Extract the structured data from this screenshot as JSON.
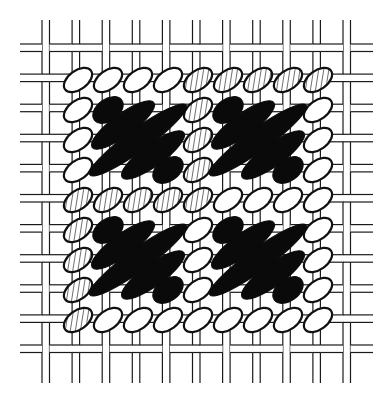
{
  "diagram": {
    "title": "",
    "canvas": {
      "thread_pairs_vertical": 11,
      "thread_pairs_horizontal": 11
    },
    "stitch_grid": {
      "columns": 9,
      "rows": 9
    },
    "colors": {
      "ink": "#111111",
      "background": "#ffffff",
      "black_stitch": "#0a0a0a"
    },
    "border_stitches": [
      {
        "col": 0,
        "row": 0,
        "fill": "white"
      },
      {
        "col": 1,
        "row": 0,
        "fill": "white"
      },
      {
        "col": 2,
        "row": 0,
        "fill": "white"
      },
      {
        "col": 3,
        "row": 0,
        "fill": "white"
      },
      {
        "col": 4,
        "row": 0,
        "fill": "hatched"
      },
      {
        "col": 5,
        "row": 0,
        "fill": "hatched"
      },
      {
        "col": 6,
        "row": 0,
        "fill": "hatched"
      },
      {
        "col": 7,
        "row": 0,
        "fill": "hatched"
      },
      {
        "col": 8,
        "row": 0,
        "fill": "hatched"
      },
      {
        "col": 0,
        "row": 1,
        "fill": "white"
      },
      {
        "col": 0,
        "row": 2,
        "fill": "white"
      },
      {
        "col": 0,
        "row": 3,
        "fill": "white"
      },
      {
        "col": 0,
        "row": 4,
        "fill": "hatched"
      },
      {
        "col": 0,
        "row": 5,
        "fill": "hatched"
      },
      {
        "col": 0,
        "row": 6,
        "fill": "hatched"
      },
      {
        "col": 0,
        "row": 7,
        "fill": "hatched"
      },
      {
        "col": 0,
        "row": 8,
        "fill": "hatched"
      },
      {
        "col": 1,
        "row": 4,
        "fill": "hatched"
      },
      {
        "col": 2,
        "row": 4,
        "fill": "hatched"
      },
      {
        "col": 3,
        "row": 4,
        "fill": "hatched"
      },
      {
        "col": 4,
        "row": 4,
        "fill": "hatched"
      },
      {
        "col": 5,
        "row": 4,
        "fill": "white"
      },
      {
        "col": 6,
        "row": 4,
        "fill": "white"
      },
      {
        "col": 7,
        "row": 4,
        "fill": "white"
      },
      {
        "col": 8,
        "row": 4,
        "fill": "white"
      },
      {
        "col": 4,
        "row": 1,
        "fill": "hatched"
      },
      {
        "col": 4,
        "row": 2,
        "fill": "hatched"
      },
      {
        "col": 4,
        "row": 3,
        "fill": "hatched"
      },
      {
        "col": 4,
        "row": 5,
        "fill": "white"
      },
      {
        "col": 4,
        "row": 6,
        "fill": "white"
      },
      {
        "col": 4,
        "row": 7,
        "fill": "white"
      },
      {
        "col": 4,
        "row": 8,
        "fill": "white"
      },
      {
        "col": 8,
        "row": 1,
        "fill": "white"
      },
      {
        "col": 8,
        "row": 2,
        "fill": "white"
      },
      {
        "col": 8,
        "row": 3,
        "fill": "white"
      },
      {
        "col": 8,
        "row": 5,
        "fill": "white"
      },
      {
        "col": 8,
        "row": 6,
        "fill": "white"
      },
      {
        "col": 8,
        "row": 7,
        "fill": "white"
      },
      {
        "col": 8,
        "row": 8,
        "fill": "white"
      },
      {
        "col": 1,
        "row": 8,
        "fill": "white"
      },
      {
        "col": 2,
        "row": 8,
        "fill": "white"
      },
      {
        "col": 3,
        "row": 8,
        "fill": "white"
      },
      {
        "col": 5,
        "row": 8,
        "fill": "white"
      },
      {
        "col": 6,
        "row": 8,
        "fill": "white"
      },
      {
        "col": 7,
        "row": 8,
        "fill": "white"
      }
    ],
    "blocks": [
      {
        "name": "top-left",
        "origin": [
          0,
          0
        ]
      },
      {
        "name": "top-right",
        "origin": [
          4,
          0
        ]
      },
      {
        "name": "bottom-left",
        "origin": [
          0,
          4
        ]
      },
      {
        "name": "bottom-right",
        "origin": [
          4,
          4
        ]
      }
    ],
    "block_black_stitches": [
      {
        "from": [
          1,
          1
        ],
        "to": [
          1,
          1
        ]
      },
      {
        "from": [
          1,
          2
        ],
        "to": [
          2,
          1
        ]
      },
      {
        "from": [
          1,
          3
        ],
        "to": [
          3,
          1
        ]
      },
      {
        "from": [
          2,
          3
        ],
        "to": [
          3,
          2
        ]
      },
      {
        "from": [
          3,
          3
        ],
        "to": [
          3,
          3
        ]
      }
    ]
  }
}
